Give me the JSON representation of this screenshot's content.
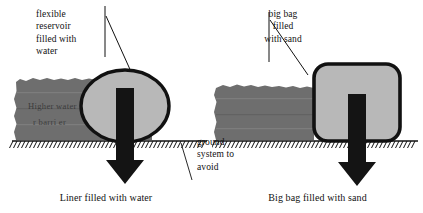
{
  "diagram": {
    "title_hidden": "",
    "colors": {
      "embankment_gray": "#6e6e6e",
      "shape_fill_gray": "#b8b8b8",
      "outline_black": "#111111",
      "arrow_black": "#141414",
      "background": "#ffffff"
    }
  },
  "left_panel": {
    "callout_label": "flexible\nreservoir\nfilled with\nwater",
    "embankment_text_line1": "Higher   water",
    "embankment_text_line2": "r barri er",
    "shape_name": "flexible-reservoir-ellipse",
    "arrow_name": "downward-load-arrow",
    "caption": "Liner filled with water"
  },
  "right_panel": {
    "callout_label": "big bag\nfilled\nwith sand",
    "shape_name": "big-bag-rounded-rect",
    "arrow_name": "downward-load-arrow",
    "caption": "Big bag filled with sand"
  },
  "ground_callout": {
    "label": "ground\nsystem to\navoid"
  }
}
